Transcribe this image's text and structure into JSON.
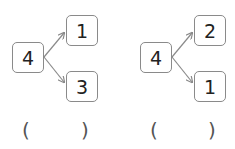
{
  "problems": [
    {
      "whole": "4",
      "part_top": "1",
      "part_bottom": "3",
      "answer_open": "(",
      "answer_close": ")",
      "answer_value": ""
    },
    {
      "whole": "4",
      "part_top": "2",
      "part_bottom": "1",
      "answer_open": "(",
      "answer_close": ")",
      "answer_value": ""
    }
  ],
  "colors": {
    "box_border": "#8a8a8a",
    "arrow": "#8a8a8a",
    "text": "#222222"
  }
}
